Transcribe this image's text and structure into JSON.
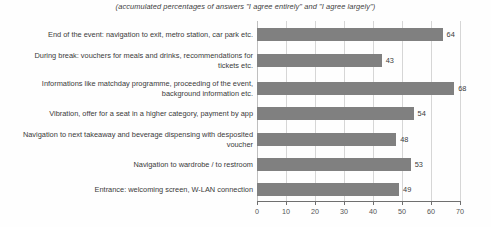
{
  "chart_data": {
    "type": "bar",
    "orientation": "horizontal",
    "title": "",
    "subtitle": "(accumulated percentages of answers \"I agree entirely\" and \"I agree largely\")",
    "xlabel": "",
    "ylabel": "",
    "xlim": [
      0,
      70
    ],
    "xticks": [
      "0",
      "10",
      "20",
      "30",
      "40",
      "50",
      "60",
      "70"
    ],
    "grid": true,
    "legend": "none",
    "bar_color": "#808080",
    "gridline_color": "#d6d6d6",
    "axis_color": "#6f6f6f",
    "background_color": "#fefefe",
    "categories": [
      "End of the event: navigation to exit, metro station, car park etc.",
      "During break: vouchers for meals and drinks,  recommendations for tickets etc.",
      "Informations like matchday programme, proceeding of the event, background information etc.",
      "Vibration, offer for a seat in a higher category, payment by app",
      "Navigation to next takeaway and beverage dispensing with desposited voucher",
      "Navigation to wardrobe / to restroom",
      "Entrance: welcoming screen, W-LAN connection"
    ],
    "values": [
      64,
      43,
      68,
      54,
      48,
      53,
      49
    ],
    "value_labels": [
      "64",
      "43",
      "68",
      "54",
      "48",
      "53",
      "49"
    ]
  }
}
